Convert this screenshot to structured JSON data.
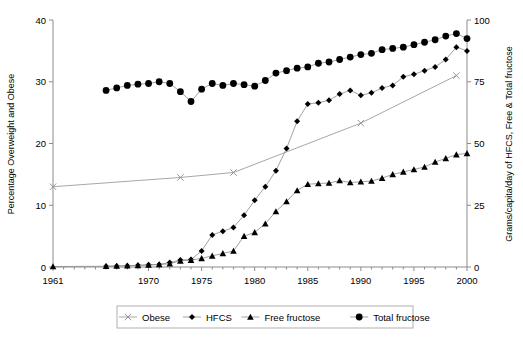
{
  "chart_data": {
    "type": "line",
    "title": "",
    "subtitle": "",
    "xlabel": "",
    "ylabel": "Percentage Overweight and Obese",
    "y2label": "Grams/capita/day of HFCS, Free & Total fructose",
    "xlim": [
      1961,
      2000
    ],
    "ylim": [
      0,
      40
    ],
    "y2lim": [
      0,
      100
    ],
    "grid": false,
    "legend_position": "bottom",
    "xticks": [
      1961,
      1970,
      1975,
      1980,
      1985,
      1990,
      1995,
      2000
    ],
    "xtick_labels": [
      "1961",
      "1970",
      "1975",
      "1980",
      "1985",
      "1990",
      "1995",
      "2000"
    ],
    "yticks": [
      0,
      10,
      20,
      30,
      40
    ],
    "ytick_labels": [
      "0",
      "10",
      "20",
      "30",
      "40"
    ],
    "y2ticks": [
      0,
      25,
      50,
      75,
      100
    ],
    "y2tick_labels": [
      "0",
      "25",
      "50",
      "75",
      "100"
    ],
    "series": [
      {
        "name": "Obese",
        "axis": "left",
        "marker": "x",
        "color": "#9d9d9d",
        "x": [
          1961,
          1973,
          1978,
          1990,
          1999
        ],
        "values": [
          13.0,
          14.5,
          15.3,
          23.3,
          31.0
        ]
      },
      {
        "name": "HFCS",
        "axis": "right",
        "marker": "diamond",
        "color": "#000000",
        "x": [
          1966,
          1967,
          1968,
          1969,
          1970,
          1971,
          1972,
          1973,
          1974,
          1975,
          1976,
          1977,
          1978,
          1979,
          1980,
          1981,
          1982,
          1983,
          1984,
          1985,
          1986,
          1987,
          1988,
          1989,
          1990,
          1991,
          1992,
          1993,
          1994,
          1995,
          1996,
          1997,
          1998,
          1999,
          2000
        ],
        "values": [
          0.3,
          0.4,
          0.5,
          0.7,
          0.9,
          1.0,
          1.8,
          2.8,
          3.0,
          6.5,
          13.0,
          14.5,
          16.0,
          21.0,
          27.0,
          32.5,
          39.0,
          48.0,
          59.0,
          66.0,
          66.5,
          67.5,
          70.0,
          71.5,
          69.5,
          70.5,
          72.5,
          73.5,
          77.0,
          78.0,
          79.5,
          81.0,
          84.0,
          89.0,
          87.5
        ]
      },
      {
        "name": "Free fructose",
        "axis": "right",
        "marker": "triangle",
        "color": "#000000",
        "x": [
          1961,
          1966,
          1967,
          1968,
          1969,
          1970,
          1971,
          1972,
          1973,
          1974,
          1975,
          1976,
          1977,
          1978,
          1979,
          1980,
          1981,
          1982,
          1983,
          1984,
          1985,
          1986,
          1987,
          1988,
          1989,
          1990,
          1991,
          1992,
          1993,
          1994,
          1995,
          1996,
          1997,
          1998,
          1999,
          2000
        ],
        "values": [
          0.2,
          0.3,
          0.4,
          0.5,
          0.6,
          0.8,
          1.0,
          1.3,
          2.5,
          2.8,
          3.5,
          4.5,
          5.5,
          6.5,
          12.5,
          14.0,
          17.5,
          22.5,
          26.5,
          31.0,
          33.5,
          33.8,
          34.0,
          35.0,
          34.2,
          34.5,
          34.8,
          36.0,
          37.5,
          38.5,
          39.5,
          40.5,
          42.5,
          44.0,
          45.5,
          46.0
        ]
      },
      {
        "name": "Total fructose",
        "axis": "right",
        "marker": "circle",
        "color": "#000000",
        "x": [
          1966,
          1967,
          1968,
          1969,
          1970,
          1971,
          1972,
          1973,
          1974,
          1975,
          1976,
          1977,
          1978,
          1979,
          1980,
          1981,
          1982,
          1983,
          1984,
          1985,
          1986,
          1987,
          1988,
          1989,
          1990,
          1991,
          1992,
          1993,
          1994,
          1995,
          1996,
          1997,
          1998,
          1999,
          2000
        ],
        "values": [
          71.5,
          72.5,
          73.5,
          74.0,
          74.3,
          75.0,
          74.3,
          71.0,
          67.0,
          72.0,
          74.3,
          73.5,
          74.3,
          73.8,
          73.2,
          75.5,
          78.5,
          79.5,
          80.5,
          81.0,
          82.5,
          83.0,
          84.0,
          85.0,
          86.0,
          86.5,
          88.0,
          88.5,
          89.0,
          90.0,
          91.0,
          92.0,
          93.5,
          94.5,
          92.5
        ]
      }
    ]
  },
  "legend": {
    "items": [
      {
        "label": "Obese",
        "marker": "x-marker"
      },
      {
        "label": "HFCS",
        "marker": "diamond-marker"
      },
      {
        "label": "Free fructose",
        "marker": "triangle-marker"
      },
      {
        "label": "Total fructose",
        "marker": "circle-marker"
      }
    ]
  },
  "colors": {
    "axis": "#8c8c8c",
    "line_gray": "#8a8a8a",
    "marker_black": "#000000",
    "obese_line": "#9d9d9d",
    "legend_border": "#b0b0b0"
  }
}
